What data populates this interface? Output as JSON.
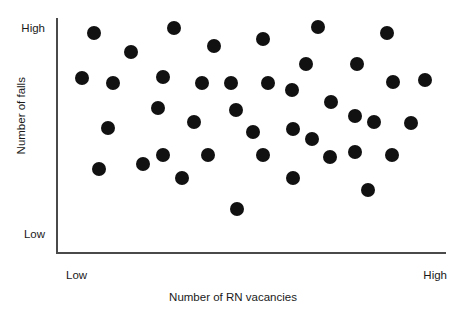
{
  "chart_data": {
    "type": "scatter",
    "title": "",
    "xlabel": "Number of RN vacancies",
    "ylabel": "Number of falls",
    "x_tick_labels": [
      "Low",
      "High"
    ],
    "y_tick_labels": [
      "Low",
      "High"
    ],
    "grid": false,
    "legend": "none",
    "marker": {
      "shape": "circle",
      "color": "#111111",
      "radius_px": 7,
      "filled": true
    },
    "axis_color": "#4a4a4a",
    "background_color": "#ffffff",
    "plot_box": {
      "x0": 56,
      "y0": 18,
      "x1": 446,
      "y1": 252
    },
    "n_points": 38,
    "note": "Qualitative scatter: axes are ordinal Low-to-High with no numeric ticks. Point positions are recorded in pixel coordinates of the rendered figure.",
    "points_px": [
      {
        "x": 94,
        "y": 33
      },
      {
        "x": 174,
        "y": 28
      },
      {
        "x": 131,
        "y": 52
      },
      {
        "x": 214,
        "y": 46
      },
      {
        "x": 263,
        "y": 39
      },
      {
        "x": 318,
        "y": 27
      },
      {
        "x": 387,
        "y": 33
      },
      {
        "x": 82,
        "y": 78
      },
      {
        "x": 113,
        "y": 83
      },
      {
        "x": 163,
        "y": 77
      },
      {
        "x": 202,
        "y": 83
      },
      {
        "x": 231,
        "y": 83
      },
      {
        "x": 268,
        "y": 83
      },
      {
        "x": 292,
        "y": 90
      },
      {
        "x": 306,
        "y": 64
      },
      {
        "x": 357,
        "y": 64
      },
      {
        "x": 393,
        "y": 82
      },
      {
        "x": 425,
        "y": 80
      },
      {
        "x": 108,
        "y": 128
      },
      {
        "x": 158,
        "y": 108
      },
      {
        "x": 194,
        "y": 122
      },
      {
        "x": 236,
        "y": 110
      },
      {
        "x": 253,
        "y": 132
      },
      {
        "x": 293,
        "y": 129
      },
      {
        "x": 312,
        "y": 139
      },
      {
        "x": 331,
        "y": 102
      },
      {
        "x": 355,
        "y": 116
      },
      {
        "x": 374,
        "y": 122
      },
      {
        "x": 411,
        "y": 123
      },
      {
        "x": 99,
        "y": 169
      },
      {
        "x": 143,
        "y": 164
      },
      {
        "x": 163,
        "y": 155
      },
      {
        "x": 182,
        "y": 178
      },
      {
        "x": 208,
        "y": 155
      },
      {
        "x": 237,
        "y": 209
      },
      {
        "x": 263,
        "y": 155
      },
      {
        "x": 293,
        "y": 178
      },
      {
        "x": 330,
        "y": 157
      },
      {
        "x": 355,
        "y": 152
      },
      {
        "x": 392,
        "y": 155
      },
      {
        "x": 368,
        "y": 190
      }
    ]
  },
  "axes": {
    "y": {
      "title": "Number of falls",
      "high_label": "High",
      "low_label": "Low"
    },
    "x": {
      "title": "Number of RN vacancies",
      "high_label": "High",
      "low_label": "Low"
    }
  }
}
